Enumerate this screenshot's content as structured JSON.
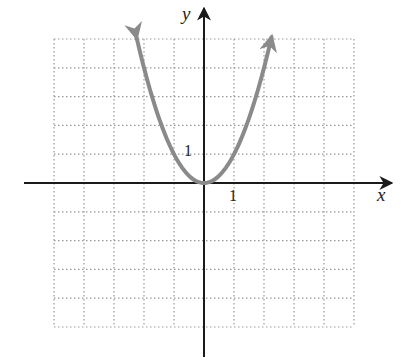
{
  "chart_data": {
    "type": "line",
    "title": "",
    "function": "y = x^2",
    "xlabel": "x",
    "ylabel": "y",
    "xlim": [
      -5,
      5
    ],
    "ylim": [
      -5,
      5
    ],
    "grid": true,
    "grid_style": "dotted",
    "tick_labels": {
      "x": [
        "1"
      ],
      "y": [
        "1"
      ]
    },
    "series": [
      {
        "name": "parabola",
        "color": "#8a8a8a",
        "arrows_at_ends": true,
        "x": [
          -2.25,
          -2,
          -1.5,
          -1,
          -0.5,
          0,
          0.5,
          1,
          1.5,
          2,
          2.25
        ],
        "y": [
          5.06,
          4,
          2.25,
          1,
          0.25,
          0,
          0.25,
          1,
          2.25,
          4,
          5.06
        ]
      }
    ]
  },
  "labels": {
    "x_axis": "x",
    "y_axis": "y",
    "x_tick_one": "1",
    "y_tick_one": "1"
  },
  "colors": {
    "axis": "#1a1a1a",
    "grid": "#9a9a9a",
    "curve": "#8a8a8a"
  }
}
